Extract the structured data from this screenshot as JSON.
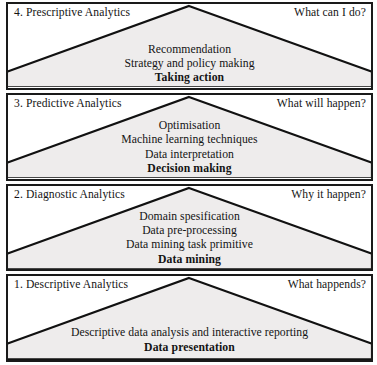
{
  "diagram": {
    "colors": {
      "wedge_fill": "#eeecec",
      "wedge_stroke": "#111111",
      "panel_border": "#1a1a1a",
      "background": "#ffffff",
      "text": "#141414"
    },
    "levels": [
      {
        "number": "4.",
        "title": "4. Prescriptive Analytics",
        "question": "What can I do?",
        "lines": [
          "Recommendation",
          "Strategy and policy making"
        ],
        "outcome": "Taking action"
      },
      {
        "number": "3.",
        "title": "3. Predictive Analytics",
        "question": "What will happen?",
        "lines": [
          "Optimisation",
          "Machine learning techniques",
          "Data interpretation"
        ],
        "outcome": "Decision making"
      },
      {
        "number": "2.",
        "title": "2. Diagnostic Analytics",
        "question": "Why it happen?",
        "lines": [
          "Domain spesification",
          "Data pre-processing",
          "Data mining task primitive"
        ],
        "outcome": "Data mining"
      },
      {
        "number": "1.",
        "title": "1. Descriptive Analytics",
        "question": "What happends?",
        "lines": [
          "Descriptive data analysis and interactive reporting"
        ],
        "outcome": "Data presentation"
      }
    ]
  }
}
